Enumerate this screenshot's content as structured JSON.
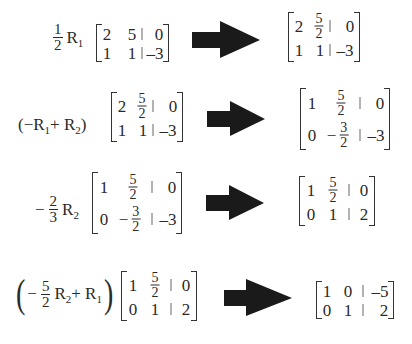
{
  "steps": [
    {
      "operation": {
        "coef_num": "1",
        "coef_den": "2",
        "row": "R",
        "row_sub": "1"
      },
      "before": {
        "r1": [
          "2",
          "5",
          "0"
        ],
        "r2": [
          "1",
          "1",
          "-3"
        ]
      },
      "after": {
        "r1": [
          "2",
          {
            "num": "5",
            "den": "2"
          },
          "0"
        ],
        "r2": [
          "1",
          "1",
          "-3"
        ]
      }
    },
    {
      "operation": {
        "text": "(−R1 + R2)",
        "open": "(−R",
        "sub1": "1",
        "plus": " + R",
        "sub2": "2",
        "close": ")"
      },
      "before": {
        "r1": [
          "2",
          {
            "num": "5",
            "den": "2"
          },
          "0"
        ],
        "r2": [
          "1",
          "1",
          "-3"
        ]
      },
      "after": {
        "r1": [
          "1",
          {
            "num": "5",
            "den": "2"
          },
          "0"
        ],
        "r2": [
          "0",
          {
            "sign": "−",
            "num": "3",
            "den": "2"
          },
          "-3"
        ]
      }
    },
    {
      "operation": {
        "sign": "−",
        "coef_num": "2",
        "coef_den": "3",
        "row": "R",
        "row_sub": "2"
      },
      "before": {
        "r1": [
          "1",
          {
            "num": "5",
            "den": "2"
          },
          "0"
        ],
        "r2": [
          "0",
          {
            "sign": "−",
            "num": "3",
            "den": "2"
          },
          "-3"
        ]
      },
      "after": {
        "r1": [
          "1",
          {
            "num": "5",
            "den": "2"
          },
          "0"
        ],
        "r2": [
          "0",
          "1",
          "2"
        ]
      }
    },
    {
      "operation": {
        "sign": "−",
        "coef_num": "5",
        "coef_den": "2",
        "row": "R",
        "row_sub": "2",
        "plus": " + R",
        "sub2": "1"
      },
      "before": {
        "r1": [
          "1",
          {
            "num": "5",
            "den": "2"
          },
          "0"
        ],
        "r2": [
          "0",
          "1",
          "2"
        ]
      },
      "after": {
        "r1": [
          "1",
          "0",
          "-5"
        ],
        "r2": [
          "0",
          "1",
          "2"
        ]
      }
    }
  ],
  "display": {
    "minus": "–",
    "neg3": "–3",
    "neg5": "–5",
    "frac_minus": "−",
    "paren_open": "(",
    "paren_close": ")",
    "plus_R": " + R"
  },
  "arrow_color": "#1a1a1a"
}
